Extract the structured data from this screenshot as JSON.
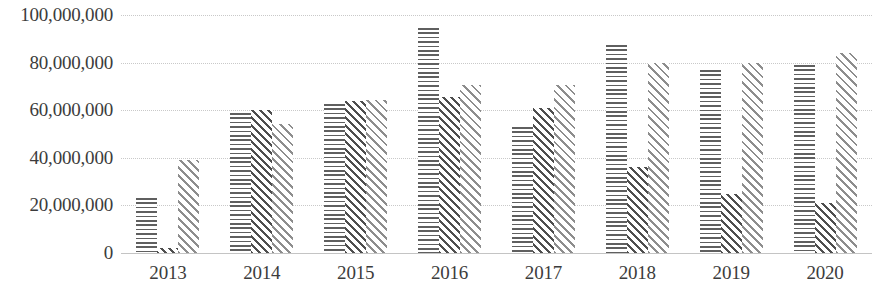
{
  "chart_data": {
    "type": "bar",
    "title": "",
    "subtitle": "",
    "xlabel": "",
    "ylabel": "",
    "categories": [
      "2013",
      "2014",
      "2015",
      "2016",
      "2017",
      "2018",
      "2019",
      "2020"
    ],
    "ylim": [
      0,
      100000000
    ],
    "y_tick_labels": [
      "100,000,000",
      "80,000,000",
      "60,000,000",
      "40,000,000",
      "20,000,000",
      "0"
    ],
    "y_tick_values": [
      100000000,
      80000000,
      60000000,
      40000000,
      20000000,
      0
    ],
    "grid": true,
    "grid_axis": "y",
    "legend": "none",
    "series": [
      {
        "name": "series-1",
        "pattern": "dotted-fill",
        "color": "#5f5f5f",
        "values": [
          23000000,
          59000000,
          62500000,
          94500000,
          53000000,
          87500000,
          77000000,
          79000000
        ]
      },
      {
        "name": "series-2",
        "pattern": "dark-diagonal-hatch",
        "color": "#4e4e4e",
        "values": [
          2000000,
          60000000,
          64000000,
          65500000,
          61000000,
          36000000,
          25000000,
          21000000
        ]
      },
      {
        "name": "series-3",
        "pattern": "light-diagonal-hatch",
        "color": "#8d8d8d",
        "values": [
          39000000,
          54000000,
          64500000,
          70500000,
          70500000,
          80000000,
          80000000,
          84000000
        ]
      }
    ]
  },
  "artifacts": {
    "top_left_smudge": "",
    "top_right_smudge": ""
  }
}
